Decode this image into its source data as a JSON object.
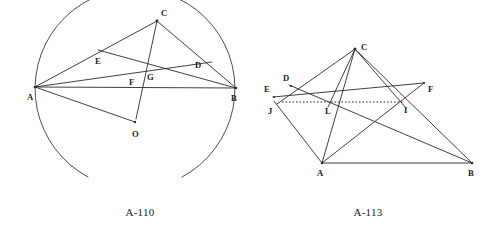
{
  "sheet": {
    "width": 499,
    "height": 235,
    "background": "#ffffff",
    "ink_color": "#2b2b2b"
  },
  "figures": [
    {
      "id": "A-110",
      "caption": "A-110",
      "caption_pos": {
        "x": 140,
        "y": 216
      },
      "description": "Triangle ABC inscribed in a circle with center O, cevians and interior points E, F, G, D",
      "circle": {
        "name": "circumcircle",
        "cx": 135,
        "cy": 89,
        "r": 100,
        "arc_start_deg": -62,
        "arc_sweep_deg": 297
      },
      "points": [
        {
          "id": "A",
          "label": "A",
          "x": 35,
          "y": 87,
          "label_x": 27,
          "label_y": 100
        },
        {
          "id": "B",
          "label": "B",
          "x": 236,
          "y": 88,
          "label_x": 231,
          "label_y": 101
        },
        {
          "id": "C",
          "label": "C",
          "x": 157,
          "y": 21,
          "label_x": 161,
          "label_y": 16
        },
        {
          "id": "D",
          "label": "D",
          "x": 205,
          "y": 68,
          "label_x": 195,
          "label_y": 68
        },
        {
          "id": "E",
          "label": "E",
          "x": 103,
          "y": 55,
          "label_x": 95,
          "label_y": 64
        },
        {
          "id": "F",
          "label": "F",
          "x": 139,
          "y": 83,
          "label_x": 129,
          "label_y": 85
        },
        {
          "id": "G",
          "label": "G",
          "x": 148,
          "y": 77,
          "label_x": 147,
          "label_y": 80
        },
        {
          "id": "O",
          "label": "O",
          "x": 135,
          "y": 122,
          "label_x": 132,
          "label_y": 137
        }
      ],
      "segments": [
        {
          "name": "AB",
          "from": "A",
          "to": "B"
        },
        {
          "name": "AC",
          "from": "A",
          "to": "C"
        },
        {
          "name": "BC",
          "from": "B",
          "to": "C"
        },
        {
          "name": "AO",
          "from": "A",
          "to": "O"
        },
        {
          "name": "CO",
          "from": "C",
          "to": "O"
        },
        {
          "name": "AD",
          "from": "A",
          "to": "D-ext"
        },
        {
          "name": "BE",
          "from": "B",
          "to": "E-ext"
        },
        {
          "name": "CF",
          "from": "C",
          "to": "F-lower"
        }
      ]
    },
    {
      "id": "A-113",
      "caption": "A-113",
      "caption_pos": {
        "x": 368,
        "y": 216
      },
      "description": "Triangle ABC with cevians and transversal lines EF and DJ crossing at L and I, dotted segment LI",
      "points": [
        {
          "id": "A",
          "label": "A",
          "x": 322,
          "y": 163,
          "label_x": 317,
          "label_y": 176
        },
        {
          "id": "B",
          "label": "B",
          "x": 472,
          "y": 163,
          "label_x": 468,
          "label_y": 176
        },
        {
          "id": "C",
          "label": "C",
          "x": 355,
          "y": 49,
          "label_x": 361,
          "label_y": 50
        },
        {
          "id": "D",
          "label": "D",
          "x": 291,
          "y": 86,
          "label_x": 283,
          "label_y": 81
        },
        {
          "id": "E",
          "label": "E",
          "x": 275,
          "y": 96,
          "label_x": 264,
          "label_y": 92
        },
        {
          "id": "F",
          "label": "F",
          "x": 424,
          "y": 84,
          "label_x": 428,
          "label_y": 92
        },
        {
          "id": "I",
          "label": "I",
          "x": 404,
          "y": 102,
          "label_x": 404,
          "label_y": 113
        },
        {
          "id": "J",
          "label": "J",
          "x": 277,
          "y": 104,
          "label_x": 268,
          "label_y": 114
        },
        {
          "id": "L",
          "label": "L",
          "x": 330,
          "y": 102,
          "label_x": 325,
          "label_y": 114
        }
      ],
      "segments": [
        {
          "name": "AB",
          "from": "A",
          "to": "B"
        },
        {
          "name": "AC",
          "from": "A",
          "to": "C"
        },
        {
          "name": "CB",
          "from": "C",
          "to": "B"
        },
        {
          "name": "CJ",
          "from": "C",
          "to": "J"
        },
        {
          "name": "CL",
          "from": "C",
          "to": "L"
        },
        {
          "name": "CI",
          "from": "C",
          "to": "I"
        },
        {
          "name": "EF",
          "from": "E",
          "to": "F"
        },
        {
          "name": "DJ-AB",
          "from": "D",
          "to": "B"
        },
        {
          "name": "JA",
          "from": "J",
          "to": "A"
        },
        {
          "name": "AI-F",
          "from": "A",
          "to": "F-dir"
        },
        {
          "name": "LI-dotted",
          "from": "L",
          "to": "I",
          "style": "dotted"
        }
      ]
    }
  ]
}
